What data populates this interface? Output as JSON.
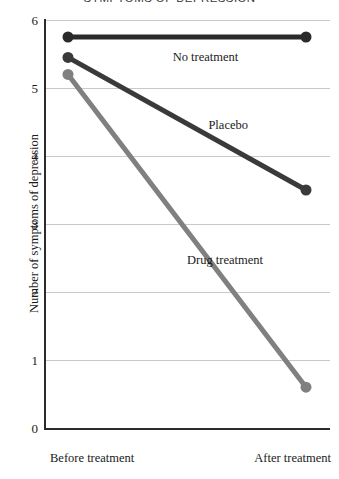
{
  "chart_data": {
    "type": "line",
    "title": "SYMPTOMS OF DEPRESSION",
    "xlabel": "",
    "ylabel": "Number of symptoms of depression",
    "categories": [
      "Before treatment",
      "After treatment"
    ],
    "x": [
      0,
      1
    ],
    "ylim": [
      0,
      6
    ],
    "ytick_labels": [
      "0",
      "1",
      "2",
      "3",
      "4",
      "5",
      "6"
    ],
    "ytick_values": [
      0,
      1,
      2,
      3,
      4,
      5,
      6
    ],
    "grid": true,
    "grid_axis": "y",
    "legend": "inline-labels",
    "markers": "filled-circle",
    "series": [
      {
        "name": "No treatment",
        "values": [
          5.75,
          5.75
        ],
        "color": "#2a2a2a",
        "label_x_pct": 44,
        "label_y_value": 5.45
      },
      {
        "name": "Placebo",
        "values": [
          5.45,
          3.5
        ],
        "color": "#3a3a3a",
        "label_x_pct": 59,
        "label_y_value": 4.45
      },
      {
        "name": "Drug treatment",
        "values": [
          5.2,
          0.6
        ],
        "color": "#808080",
        "label_x_pct": 50,
        "label_y_value": 2.47
      }
    ]
  },
  "axis": {
    "y_title": "Number of symptoms of depression",
    "x_labels": {
      "before": "Before treatment",
      "after": "After treatment"
    },
    "y_labels": {
      "v6": "6",
      "v5": "5",
      "v4": "4",
      "v3": "3",
      "v2": "2",
      "v1": "1",
      "v0": "0"
    }
  },
  "series_labels": {
    "no_treatment": "No treatment",
    "placebo": "Placebo",
    "drug_treatment": "Drug treatment"
  },
  "colors": {
    "background": "#ffffff",
    "axis": "#2b2b2b",
    "grid": "#c9c9c9",
    "text": "#1a1a1a",
    "no_treatment": "#2a2a2a",
    "placebo": "#3a3a3a",
    "drug_treatment": "#808080"
  }
}
